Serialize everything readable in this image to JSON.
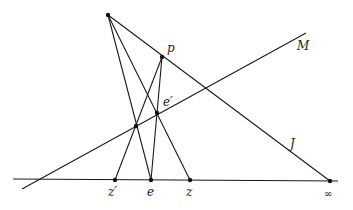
{
  "diagram": {
    "type": "projective-geometry-construction",
    "points": {
      "apex": {
        "label": "",
        "x": 108,
        "y": 15
      },
      "p": {
        "label": "p",
        "x": 162,
        "y": 57
      },
      "e_prime": {
        "label": "e′",
        "x": 157,
        "y": 113
      },
      "q": {
        "label": "",
        "x": 136,
        "y": 126
      },
      "z_prime": {
        "label": "z′",
        "x": 115,
        "y": 180
      },
      "e": {
        "label": "e",
        "x": 151,
        "y": 180
      },
      "z": {
        "label": "z",
        "x": 190,
        "y": 180
      },
      "infinity": {
        "label": "∞",
        "x": 330,
        "y": 181
      }
    },
    "lines": {
      "M": {
        "label": "M"
      },
      "J": {
        "label": "J"
      },
      "baseline": {
        "label": ""
      }
    }
  }
}
